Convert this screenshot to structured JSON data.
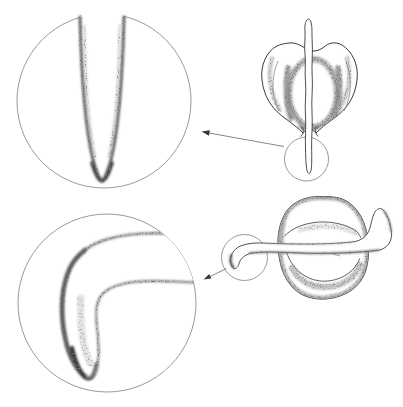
{
  "canvas": {
    "width_px": 403,
    "height_px": 407,
    "background": "#ffffff"
  },
  "palette": {
    "paper": "#ffffff",
    "ink": "#3a3a3a",
    "stipple": "#2e2e2e",
    "circle_outline": "#9a9a9a",
    "arrow": "#787878"
  },
  "figure": {
    "kind": "stippled-botanical-illustration",
    "text_content": "",
    "panels": [
      {
        "id": "magnified-root-tip-straight",
        "glyph": "magnifier-circle",
        "position": "top-left",
        "content": "straight-root-tip-pointing-down"
      },
      {
        "id": "germinating-seed-upright",
        "glyph": "seed-drawing",
        "position": "top-right",
        "content": "seed-with-vertical-radicle-and-callout-circle"
      },
      {
        "id": "magnified-root-tip-curved",
        "glyph": "magnifier-circle",
        "position": "bottom-left",
        "content": "root-tip-curving-downward"
      },
      {
        "id": "germinating-seed-horizontal",
        "glyph": "seed-drawing",
        "position": "bottom-right",
        "content": "seed-on-side-with-horizontal-radicle-curving-down-and-callout-circle"
      }
    ],
    "callouts": [
      {
        "glyph": "arrow",
        "from": "germinating-seed-upright",
        "to": "magnified-root-tip-straight"
      },
      {
        "glyph": "arrow",
        "from": "germinating-seed-horizontal",
        "to": "magnified-root-tip-curved"
      }
    ]
  }
}
